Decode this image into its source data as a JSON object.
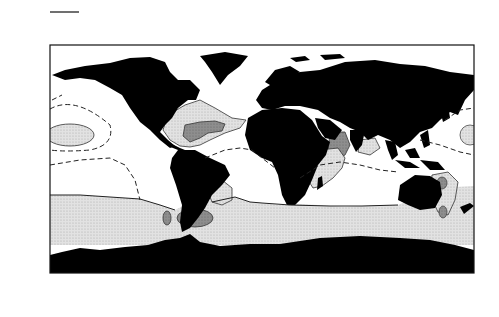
{
  "figure": {
    "title_overline": true
  },
  "chart_data": {
    "type": "heatmap",
    "subtype": "world map contour plot",
    "xlabel": "",
    "ylabel": "",
    "x_ticks": [
      "180'",
      "120'W",
      "60'W",
      "0'",
      "60",
      "120'E",
      "180'"
    ],
    "y_ticks": [
      "90'N",
      "60'N",
      "30'N",
      "0'",
      "30'S",
      "60'S",
      "90'S"
    ],
    "xlim": [
      -180,
      180
    ],
    "ylim": [
      -90,
      90
    ],
    "contour_levels": [
      0.1,
      0.2,
      0.3
    ],
    "contour_labels": [
      {
        "value": "0.1",
        "lon": -160,
        "lat": 33,
        "style": "dashed"
      },
      {
        "value": "0.2",
        "lon": -171,
        "lat": 27,
        "style": "solid"
      },
      {
        "value": "0.1",
        "lon": -150,
        "lat": 0,
        "style": "dashed"
      },
      {
        "value": "0.2",
        "lon": -140,
        "lat": -38,
        "style": "solid"
      },
      {
        "value": "0.3",
        "lon": -60,
        "lat": 25,
        "style": "solid"
      },
      {
        "value": "0.2",
        "lon": -55,
        "lat": 10,
        "style": "solid"
      },
      {
        "value": "0.1",
        "lon": -30,
        "lat": 4,
        "style": "dashed"
      },
      {
        "value": "0.3",
        "lon": -40,
        "lat": -15,
        "style": "solid"
      },
      {
        "value": "0.1",
        "lon": 38,
        "lat": 0,
        "style": "dashed"
      },
      {
        "value": "0.1",
        "lon": 55,
        "lat": -15,
        "style": "dashed"
      },
      {
        "value": "0.1",
        "lon": 80,
        "lat": -13,
        "style": "dashed"
      },
      {
        "value": "0.2",
        "lon": 40,
        "lat": -35,
        "style": "solid"
      },
      {
        "value": "0.1",
        "lon": 150,
        "lat": 17,
        "style": "dashed"
      },
      {
        "value": "0.2",
        "lon": 172,
        "lat": 25,
        "style": "solid"
      }
    ],
    "shading": {
      "land": "#000000",
      "lt_0.2": "#ffffff",
      "0.2_to_0.3": "#d6d6d6",
      "gt_0.3": "#8c8c8c"
    },
    "grid": false,
    "legend": "none"
  },
  "axes": {
    "y_ticks": [
      {
        "label": "90'N",
        "y": 45
      },
      {
        "label": "60'N",
        "y": 83
      },
      {
        "label": "30'N",
        "y": 121
      },
      {
        "label": "0'",
        "y": 159
      },
      {
        "label": "30'S",
        "y": 197
      },
      {
        "label": "60'S",
        "y": 235
      },
      {
        "label": "90'S",
        "y": 272
      }
    ],
    "x_ticks": [
      {
        "label": "180'",
        "x": 50
      },
      {
        "label": "120'W",
        "x": 121
      },
      {
        "label": "60'W",
        "x": 191
      },
      {
        "label": "0'",
        "x": 262
      },
      {
        "label": "60",
        "x": 332
      },
      {
        "label": "120'E",
        "x": 403
      },
      {
        "label": "180'",
        "x": 474
      }
    ]
  }
}
